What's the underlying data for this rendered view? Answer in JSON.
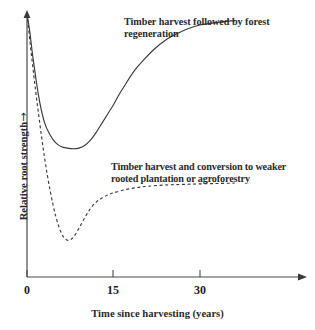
{
  "figure": {
    "background_color": "#ffffff",
    "line_color": "#3a3a3a",
    "text_color": "#2a2a2a"
  },
  "axes": {
    "x": {
      "title": "Time since harvesting (years)",
      "tick_labels": [
        "0",
        "15",
        "30"
      ],
      "tick_values": [
        0,
        15,
        30
      ],
      "range": [
        0,
        36
      ],
      "arrow": true
    },
    "y": {
      "title": "Relative root strength",
      "title_arrow": "→",
      "tick_labels": [],
      "range": [
        0,
        1
      ],
      "arrow": true
    }
  },
  "annotations": {
    "forest": {
      "line1": "Timber harvest followed by forest",
      "line2": "regeneration"
    },
    "plantation": {
      "line1": "Timber harvest and conversion to weaker",
      "line2": "rooted plantation or agroforestry"
    }
  },
  "chart_data": {
    "type": "line",
    "title": "",
    "xlabel": "Time since harvesting (years)",
    "ylabel": "Relative root strength",
    "xlim": [
      0,
      36
    ],
    "ylim": [
      0,
      1
    ],
    "grid": false,
    "legend": "inline-annotations",
    "x_ticks": [
      0,
      15,
      30
    ],
    "y_ticks": [],
    "series": [
      {
        "name": "Timber harvest followed by forest regeneration",
        "style": "solid",
        "color": "#3a3a3a",
        "label_text": "Timber harvest followed by forest regeneration",
        "x": [
          0,
          0.5,
          1,
          2,
          3,
          4,
          5,
          6,
          7,
          8,
          9,
          10,
          11,
          12,
          13,
          14,
          15,
          16,
          17,
          18,
          19,
          20,
          22,
          24,
          26,
          28,
          30,
          33,
          36
        ],
        "y": [
          1.0,
          0.93,
          0.84,
          0.69,
          0.59,
          0.54,
          0.51,
          0.495,
          0.49,
          0.4875,
          0.49,
          0.5,
          0.52,
          0.55,
          0.585,
          0.62,
          0.655,
          0.695,
          0.73,
          0.765,
          0.795,
          0.82,
          0.865,
          0.9,
          0.925,
          0.945,
          0.958,
          0.968,
          0.975
        ]
      },
      {
        "name": "Timber harvest and conversion to weaker rooted plantation or agroforestry",
        "style": "dashed",
        "color": "#3a3a3a",
        "label_text": "Timber harvest and conversion to weaker rooted plantation or agroforestry",
        "x": [
          0,
          1,
          2,
          3,
          4,
          5,
          6,
          7,
          8,
          9,
          10,
          11,
          12,
          13,
          14,
          15,
          17,
          19,
          21,
          24,
          27,
          30,
          33,
          36
        ],
        "y": [
          1.0,
          0.8,
          0.62,
          0.46,
          0.33,
          0.23,
          0.165,
          0.14,
          0.15,
          0.185,
          0.225,
          0.26,
          0.285,
          0.3,
          0.312,
          0.32,
          0.332,
          0.34,
          0.345,
          0.35,
          0.352,
          0.354,
          0.3555,
          0.357
        ]
      }
    ]
  }
}
